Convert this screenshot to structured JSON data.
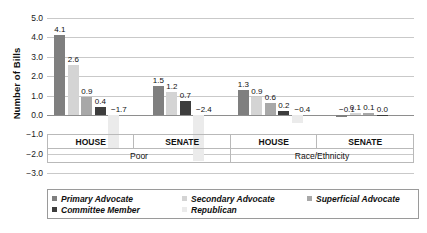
{
  "chart_data": {
    "type": "bar",
    "title": "",
    "xlabel": "",
    "ylabel": "Number of Bills",
    "ylim": [
      -3.0,
      5.0
    ],
    "ytick_labels": [
      "5.0",
      "4.0",
      "3.0",
      "2.0",
      "1.0",
      "0.0",
      "-1.0",
      "-2.0",
      "-3.0"
    ],
    "ytick_values": [
      5.0,
      4.0,
      3.0,
      2.0,
      1.0,
      0.0,
      -1.0,
      -2.0,
      -3.0
    ],
    "grid": true,
    "legend_position": "bottom",
    "series": [
      {
        "name": "Primary Advocate",
        "color": "#7f7f7f"
      },
      {
        "name": "Secondary Advocate",
        "color": "#d4d4d4"
      },
      {
        "name": "Superficial Advocate",
        "color": "#a8a8a8"
      },
      {
        "name": "Committee Member",
        "color": "#3d3d3d"
      },
      {
        "name": "Republican",
        "color": "#ebebeb"
      }
    ],
    "topic_groups": [
      {
        "topic": "Poor",
        "chambers": [
          "HOUSE",
          "SENATE"
        ]
      },
      {
        "topic": "Race/Ethnicity",
        "chambers": [
          "HOUSE",
          "SENATE"
        ]
      }
    ],
    "groups": [
      {
        "topic": "Poor",
        "chamber": "HOUSE",
        "values": [
          4.1,
          2.6,
          0.9,
          0.4,
          -1.7
        ],
        "labels": [
          "4.1",
          "2.6",
          "0.9",
          "0.4",
          "-1.7"
        ]
      },
      {
        "topic": "Poor",
        "chamber": "SENATE",
        "values": [
          1.5,
          1.2,
          null,
          0.7,
          -2.4
        ],
        "labels": [
          "1.5",
          "1.2",
          "",
          "0.7",
          "-2.4"
        ]
      },
      {
        "topic": "Race/Ethnicity",
        "chamber": "HOUSE",
        "values": [
          1.3,
          0.9,
          0.6,
          0.2,
          -0.4
        ],
        "labels": [
          "1.3",
          "0.9",
          "0.6",
          "0.2",
          "-0.4"
        ]
      },
      {
        "topic": "Race/Ethnicity",
        "chamber": "SENATE",
        "values": [
          -0.1,
          0.1,
          0.1,
          0.0,
          null
        ],
        "labels": [
          "-0.1",
          "0.1",
          "0.1",
          "0.0",
          ""
        ]
      }
    ]
  },
  "axis": {
    "y_title": "Number of Bills"
  },
  "categories": {
    "row_chambers": [
      "HOUSE",
      "SENATE",
      "HOUSE",
      "SENATE"
    ],
    "row_topics": [
      "Poor",
      "Race/Ethnicity"
    ]
  },
  "legend": {
    "row1": [
      "Primary Advocate",
      "Secondary Advocate",
      "Superficial Advocate"
    ],
    "row2": [
      "Committee Member",
      "Republican"
    ]
  },
  "colors": {
    "primary_advocate": "#7f7f7f",
    "secondary_advocate": "#d4d4d4",
    "superficial_advocate": "#a8a8a8",
    "committee_member": "#3d3d3d",
    "republican": "#ebebeb",
    "gridline": "#c9c9c9",
    "zeroline": "#8e8e8e",
    "text": "#111111"
  }
}
